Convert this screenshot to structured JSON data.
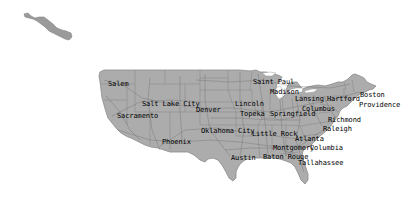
{
  "map": {
    "background": "#ffffff",
    "land_fill": "#aaaaaa",
    "border_color": "#7a7a7a",
    "road_color": "#6e6e6e",
    "label_color": "#000000",
    "regions": [
      {
        "name": "Alaska (partial)",
        "type": "landmass"
      },
      {
        "name": "Contiguous United States",
        "type": "landmass"
      }
    ]
  },
  "cities": [
    {
      "name": "Salem",
      "x": 108,
      "y": 80
    },
    {
      "name": "Salt Lake City",
      "x": 142,
      "y": 100
    },
    {
      "name": "Sacramento",
      "x": 117,
      "y": 112
    },
    {
      "name": "Denver",
      "x": 196,
      "y": 106
    },
    {
      "name": "Phoenix",
      "x": 162,
      "y": 138
    },
    {
      "name": "Oklahoma City",
      "x": 201,
      "y": 127
    },
    {
      "name": "Lincoln",
      "x": 235,
      "y": 100
    },
    {
      "name": "Topeka",
      "x": 240,
      "y": 110
    },
    {
      "name": "Saint Paul",
      "x": 253,
      "y": 78
    },
    {
      "name": "Madison",
      "x": 270,
      "y": 88
    },
    {
      "name": "Springfield",
      "x": 270,
      "y": 110
    },
    {
      "name": "Little Rock",
      "x": 252,
      "y": 130
    },
    {
      "name": "Lansing",
      "x": 295,
      "y": 95
    },
    {
      "name": "Hartford",
      "x": 327,
      "y": 95
    },
    {
      "name": "Boston",
      "x": 360,
      "y": 91
    },
    {
      "name": "Providence",
      "x": 359,
      "y": 101
    },
    {
      "name": "Columbus",
      "x": 302,
      "y": 105
    },
    {
      "name": "Richmond",
      "x": 328,
      "y": 116
    },
    {
      "name": "Raleigh",
      "x": 323,
      "y": 125
    },
    {
      "name": "Atlanta",
      "x": 295,
      "y": 135
    },
    {
      "name": "Montgomery",
      "x": 273,
      "y": 144
    },
    {
      "name": "Columbia",
      "x": 310,
      "y": 144
    },
    {
      "name": "Austin",
      "x": 231,
      "y": 154
    },
    {
      "name": "Baton Rouge",
      "x": 263,
      "y": 153
    },
    {
      "name": "Tallahassee",
      "x": 298,
      "y": 159
    }
  ]
}
